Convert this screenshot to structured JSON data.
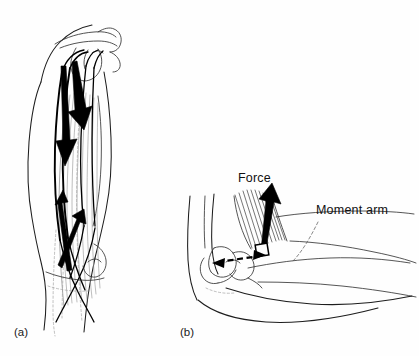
{
  "figure": {
    "type": "anatomical-line-diagram",
    "background_color": "#fefefe",
    "ink_color": "#1d1d1d",
    "panels": [
      {
        "id": "a",
        "label": "(a)",
        "caption_position": {
          "x": 14,
          "y": 336
        },
        "subject": "anterior view of upper arm showing elbow flexor muscle lines of action",
        "annotations": []
      },
      {
        "id": "b",
        "label": "(b)",
        "caption_position": {
          "x": 180,
          "y": 336
        },
        "subject": "lateral view of flexed elbow showing muscle force vector and moment arm",
        "annotations": [
          {
            "name": "force-label",
            "text": "Force",
            "x": 238,
            "y": 182,
            "anchor": "start"
          },
          {
            "name": "moment-arm-label",
            "text": "Moment  arm",
            "x": 316,
            "y": 214,
            "anchor": "start"
          }
        ]
      }
    ],
    "vectors": {
      "force_arrow_color": "#000000",
      "moment_arm_style": "dashed double-headed arrow",
      "right_angle_marker": "square"
    }
  }
}
